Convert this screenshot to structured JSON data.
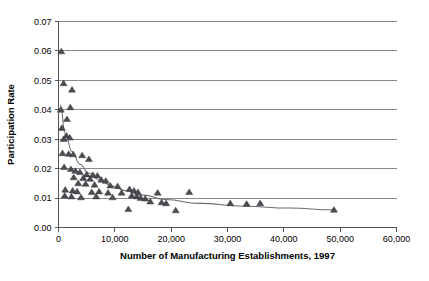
{
  "chart_data": {
    "type": "scatter",
    "title": "",
    "xlabel": "Number of Manufacturing Establishments, 1997",
    "ylabel": "Participation Rate",
    "xlim": [
      0,
      60000
    ],
    "ylim": [
      0.0,
      0.07
    ],
    "xticks": [
      0,
      10000,
      20000,
      30000,
      40000,
      50000,
      60000
    ],
    "xticklabels": [
      "0",
      "10,000",
      "20,000",
      "30,000",
      "40,000",
      "50,000",
      "60,000"
    ],
    "yticks": [
      0.0,
      0.01,
      0.02,
      0.03,
      0.04,
      0.05,
      0.06,
      0.07
    ],
    "yticklabels": [
      "0.00",
      "0.01",
      "0.02",
      "0.03",
      "0.04",
      "0.05",
      "0.06",
      "0.07"
    ],
    "grid": "horizontal",
    "legend": "none",
    "marker": "triangle",
    "marker_color": "#4b4b52",
    "trendline_color": "#6b6b70",
    "points": [
      {
        "x": 500,
        "y": 0.0598
      },
      {
        "x": 900,
        "y": 0.049
      },
      {
        "x": 2400,
        "y": 0.0468
      },
      {
        "x": 400,
        "y": 0.04
      },
      {
        "x": 2100,
        "y": 0.0408
      },
      {
        "x": 1500,
        "y": 0.0368
      },
      {
        "x": 600,
        "y": 0.0338
      },
      {
        "x": 1400,
        "y": 0.0312
      },
      {
        "x": 2000,
        "y": 0.0305
      },
      {
        "x": 900,
        "y": 0.03
      },
      {
        "x": 700,
        "y": 0.0252
      },
      {
        "x": 1800,
        "y": 0.025
      },
      {
        "x": 2600,
        "y": 0.0248
      },
      {
        "x": 4200,
        "y": 0.0245
      },
      {
        "x": 5400,
        "y": 0.0232
      },
      {
        "x": 1000,
        "y": 0.0205
      },
      {
        "x": 2200,
        "y": 0.0198
      },
      {
        "x": 3000,
        "y": 0.0192
      },
      {
        "x": 3800,
        "y": 0.0188
      },
      {
        "x": 5000,
        "y": 0.018
      },
      {
        "x": 6100,
        "y": 0.0178
      },
      {
        "x": 6900,
        "y": 0.0176
      },
      {
        "x": 2700,
        "y": 0.017
      },
      {
        "x": 4400,
        "y": 0.0168
      },
      {
        "x": 5600,
        "y": 0.0165
      },
      {
        "x": 7600,
        "y": 0.0162
      },
      {
        "x": 8400,
        "y": 0.0158
      },
      {
        "x": 3500,
        "y": 0.015
      },
      {
        "x": 4800,
        "y": 0.0148
      },
      {
        "x": 6400,
        "y": 0.0145
      },
      {
        "x": 9200,
        "y": 0.0142
      },
      {
        "x": 10500,
        "y": 0.014
      },
      {
        "x": 1200,
        "y": 0.0128
      },
      {
        "x": 2500,
        "y": 0.0125
      },
      {
        "x": 3300,
        "y": 0.0122
      },
      {
        "x": 5900,
        "y": 0.012
      },
      {
        "x": 7200,
        "y": 0.0122
      },
      {
        "x": 8800,
        "y": 0.0118
      },
      {
        "x": 11200,
        "y": 0.0118
      },
      {
        "x": 12600,
        "y": 0.013
      },
      {
        "x": 13400,
        "y": 0.0125
      },
      {
        "x": 14100,
        "y": 0.012
      },
      {
        "x": 1100,
        "y": 0.0108
      },
      {
        "x": 2300,
        "y": 0.0105
      },
      {
        "x": 4000,
        "y": 0.0102
      },
      {
        "x": 6700,
        "y": 0.0105
      },
      {
        "x": 9600,
        "y": 0.0102
      },
      {
        "x": 13000,
        "y": 0.0108
      },
      {
        "x": 13900,
        "y": 0.0105
      },
      {
        "x": 14600,
        "y": 0.01
      },
      {
        "x": 15400,
        "y": 0.0098
      },
      {
        "x": 17600,
        "y": 0.0118
      },
      {
        "x": 23200,
        "y": 0.012
      },
      {
        "x": 16300,
        "y": 0.0088
      },
      {
        "x": 18300,
        "y": 0.0085
      },
      {
        "x": 19100,
        "y": 0.0082
      },
      {
        "x": 12400,
        "y": 0.0062
      },
      {
        "x": 20800,
        "y": 0.0058
      },
      {
        "x": 30500,
        "y": 0.0082
      },
      {
        "x": 33400,
        "y": 0.008
      },
      {
        "x": 35800,
        "y": 0.0082
      },
      {
        "x": 48900,
        "y": 0.006
      }
    ],
    "trendline": [
      {
        "x": 300,
        "y": 0.0418
      },
      {
        "x": 1200,
        "y": 0.0318
      },
      {
        "x": 2400,
        "y": 0.0258
      },
      {
        "x": 3800,
        "y": 0.0215
      },
      {
        "x": 5400,
        "y": 0.0185
      },
      {
        "x": 7200,
        "y": 0.0162
      },
      {
        "x": 9400,
        "y": 0.0142
      },
      {
        "x": 12000,
        "y": 0.0125
      },
      {
        "x": 15000,
        "y": 0.011
      },
      {
        "x": 19000,
        "y": 0.0095
      },
      {
        "x": 25000,
        "y": 0.0082
      },
      {
        "x": 33000,
        "y": 0.0072
      },
      {
        "x": 41000,
        "y": 0.0066
      },
      {
        "x": 48900,
        "y": 0.006
      }
    ]
  }
}
